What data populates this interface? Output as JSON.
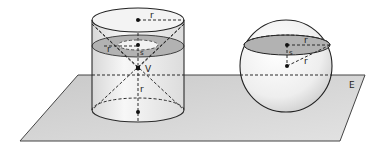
{
  "figure": {
    "plane": {
      "label": "E",
      "fill": "#cfcfcf"
    },
    "cylinder": {
      "radius_label": "r",
      "height_label_lower": "r",
      "cross_section_radius_label": "r",
      "section_distance_label": "s",
      "apex_label": "V",
      "section_fill": "#a9a9a9"
    },
    "sphere": {
      "radius_label": "r",
      "section_radius_label": "r",
      "section_distance_label": "s",
      "section_fill": "#a9a9a9"
    }
  }
}
